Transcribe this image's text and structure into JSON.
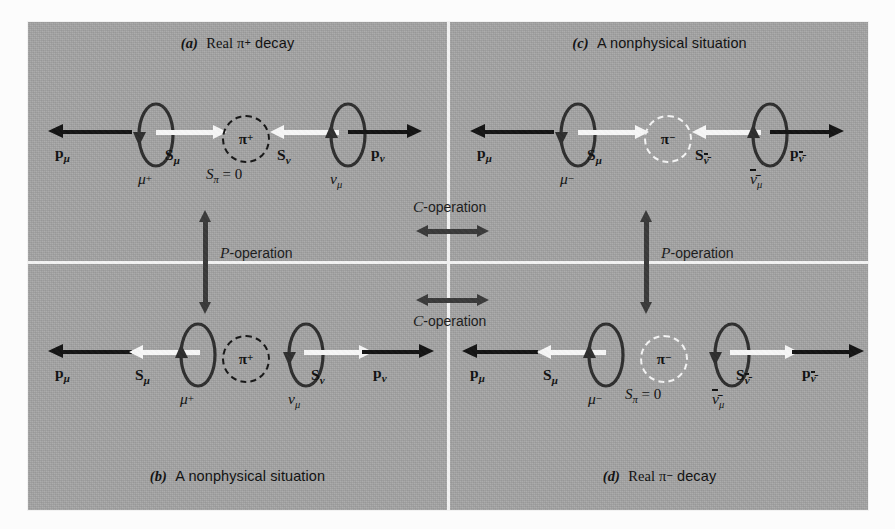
{
  "figure": {
    "background_color": "#a3a3a3",
    "divider_color": "#f2f2f2",
    "momentum_arrow_color": "#141414",
    "spin_arrow_color": "#f6f6f6",
    "operation_arrow_color": "#3a3a3a"
  },
  "panels": {
    "a": {
      "tag": "(a)",
      "title": "Real π",
      "title_sup": "+",
      "title_tail": " decay",
      "left": {
        "momentum_label": "p",
        "momentum_sub": "μ",
        "momentum_direction": "left",
        "spin_label": "S",
        "spin_sub": "μ",
        "spin_direction": "right",
        "particle": "μ",
        "particle_sup": "+",
        "particle_sub": "",
        "loop_rotation": "clockwise-down"
      },
      "center": {
        "pion": "π",
        "pion_sup": "+",
        "circle_style": "dark-dashed",
        "spin_note": "S",
        "spin_note_sub": "π",
        "spin_note_value": " = 0"
      },
      "right": {
        "momentum_label": "p",
        "momentum_sub": "ν",
        "momentum_direction": "right",
        "spin_label": "S",
        "spin_sub": "ν",
        "spin_direction": "left",
        "particle": "ν",
        "particle_sup": "",
        "particle_sub": "μ",
        "loop_rotation": "counter-up"
      }
    },
    "b": {
      "tag": "(b)",
      "title": "A nonphysical situation",
      "title_sup": "",
      "title_tail": "",
      "left": {
        "momentum_label": "p",
        "momentum_sub": "μ",
        "momentum_direction": "left",
        "spin_label": "S",
        "spin_sub": "μ",
        "spin_direction": "left",
        "particle": "μ",
        "particle_sup": "+",
        "particle_sub": "",
        "loop_rotation": "counter-up"
      },
      "center": {
        "pion": "π",
        "pion_sup": "+",
        "circle_style": "dark-dashed",
        "spin_note": "",
        "spin_note_sub": "",
        "spin_note_value": ""
      },
      "right": {
        "momentum_label": "p",
        "momentum_sub": "ν",
        "momentum_direction": "right",
        "spin_label": "S",
        "spin_sub": "ν",
        "spin_direction": "right",
        "particle": "ν",
        "particle_sup": "",
        "particle_sub": "μ",
        "loop_rotation": "clockwise-down"
      }
    },
    "c": {
      "tag": "(c)",
      "title": "A nonphysical situation",
      "title_sup": "",
      "title_tail": "",
      "left": {
        "momentum_label": "p",
        "momentum_sub": "μ",
        "momentum_direction": "left",
        "spin_label": "S",
        "spin_sub": "μ",
        "spin_direction": "right",
        "particle": "μ",
        "particle_sup": "−",
        "particle_sub": "",
        "loop_rotation": "clockwise-down"
      },
      "center": {
        "pion": "π",
        "pion_sup": "−",
        "circle_style": "light-dashed",
        "spin_note": "",
        "spin_note_sub": "",
        "spin_note_value": ""
      },
      "right": {
        "momentum_label": "p",
        "momentum_sub": "ν̄",
        "momentum_direction": "right",
        "spin_label": "S",
        "spin_sub": "ν̄",
        "spin_direction": "left",
        "particle": "ν̄",
        "particle_sup": "",
        "particle_sub": "μ",
        "loop_rotation": "counter-up"
      }
    },
    "d": {
      "tag": "(d)",
      "title": "Real π",
      "title_sup": "−",
      "title_tail": " decay",
      "left": {
        "momentum_label": "p",
        "momentum_sub": "μ",
        "momentum_direction": "left",
        "spin_label": "S",
        "spin_sub": "μ",
        "spin_direction": "left",
        "particle": "μ",
        "particle_sup": "−",
        "particle_sub": "",
        "loop_rotation": "counter-up"
      },
      "center": {
        "pion": "π",
        "pion_sup": "−",
        "circle_style": "light-dashed",
        "spin_note": "S",
        "spin_note_sub": "π",
        "spin_note_value": " = 0"
      },
      "right": {
        "momentum_label": "p",
        "momentum_sub": "ν̄",
        "momentum_direction": "right",
        "spin_label": "S",
        "spin_sub": "ν̄",
        "spin_direction": "right",
        "particle": "ν̄",
        "particle_sup": "",
        "particle_sub": "μ",
        "loop_rotation": "clockwise-down"
      }
    }
  },
  "operations": {
    "p_left": {
      "symbol": "P",
      "suffix": "-operation"
    },
    "p_right": {
      "symbol": "P",
      "suffix": "-operation"
    },
    "c_top": {
      "symbol": "C",
      "suffix": "-operation"
    },
    "c_bottom": {
      "symbol": "C",
      "suffix": "-operation"
    }
  }
}
